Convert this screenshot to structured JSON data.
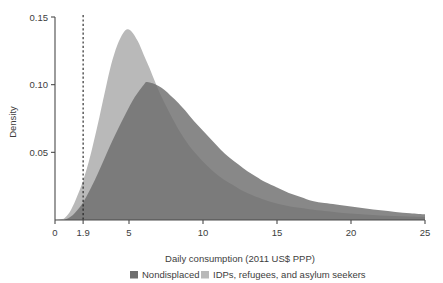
{
  "chart_data": {
    "type": "area",
    "title": "",
    "subtitle": "",
    "xlabel": "Daily consumption (2011 US$ PPP)",
    "ylabel": "Density",
    "xlim": [
      0,
      25
    ],
    "ylim": [
      0,
      0.15
    ],
    "grid": false,
    "legend_position": "bottom",
    "x_ticks": [
      {
        "value": 0,
        "label": "0"
      },
      {
        "value": 1.9,
        "label": "1.9"
      },
      {
        "value": 5,
        "label": "5"
      },
      {
        "value": 10,
        "label": "10"
      },
      {
        "value": 15,
        "label": "15"
      },
      {
        "value": 20,
        "label": "20"
      },
      {
        "value": 25,
        "label": "25"
      }
    ],
    "y_ticks": [
      {
        "value": 0.05,
        "label": "0.05"
      },
      {
        "value": 0.1,
        "label": "0.10"
      },
      {
        "value": 0.15,
        "label": "0.15"
      }
    ],
    "annotations": [
      {
        "name": "poverty-line",
        "type": "vline",
        "x": 1.9,
        "style": "dashed",
        "label": "1.9"
      }
    ],
    "colors": {
      "nondisplaced": "#6e6e6e",
      "displaced": "#b9b9b9",
      "overlap": "#8c8c8c",
      "axis": "#4a4a4a",
      "text": "#3d3d3d",
      "reference_line": "#1f1f1f"
    },
    "series": [
      {
        "name": "Nondisplaced",
        "color": "#6e6e6e",
        "x": [
          0.6,
          1.0,
          1.4,
          1.9,
          2.4,
          3.0,
          3.6,
          4.2,
          4.8,
          5.4,
          6.0,
          6.2,
          6.6,
          7.0,
          7.4,
          7.8,
          8.2,
          8.8,
          9.4,
          10.0,
          10.6,
          11.2,
          11.8,
          12.4,
          13.0,
          13.6,
          14.2,
          15.0,
          15.8,
          16.6,
          17.4,
          18.2,
          19.0,
          20.0,
          21.0,
          22.0,
          23.0,
          24.0,
          25.0
        ],
        "values": [
          0.0,
          0.002,
          0.006,
          0.013,
          0.023,
          0.037,
          0.052,
          0.066,
          0.079,
          0.091,
          0.1,
          0.102,
          0.101,
          0.099,
          0.096,
          0.092,
          0.088,
          0.081,
          0.073,
          0.066,
          0.059,
          0.052,
          0.046,
          0.041,
          0.036,
          0.032,
          0.028,
          0.024,
          0.02,
          0.017,
          0.014,
          0.0125,
          0.0115,
          0.01,
          0.0085,
          0.0072,
          0.006,
          0.005,
          0.0042
        ]
      },
      {
        "name": "IDPs, refugees, and asylum seekers",
        "color": "#b9b9b9",
        "x": [
          0.6,
          1.0,
          1.4,
          1.9,
          2.4,
          3.0,
          3.4,
          3.8,
          4.2,
          4.6,
          4.9,
          5.2,
          5.6,
          6.0,
          6.4,
          6.8,
          7.2,
          7.8,
          8.4,
          9.0,
          9.6,
          10.2,
          10.8,
          11.4,
          12.0,
          12.6,
          13.2,
          14.0,
          14.8,
          15.6,
          16.4,
          17.2,
          18.0,
          19.0,
          20.0,
          21.0,
          22.0,
          23.0,
          24.0,
          25.0
        ],
        "values": [
          0.001,
          0.006,
          0.015,
          0.029,
          0.048,
          0.076,
          0.096,
          0.115,
          0.129,
          0.138,
          0.141,
          0.139,
          0.132,
          0.122,
          0.112,
          0.101,
          0.091,
          0.078,
          0.066,
          0.056,
          0.048,
          0.041,
          0.035,
          0.03,
          0.026,
          0.022,
          0.019,
          0.0155,
          0.0128,
          0.0108,
          0.0092,
          0.008,
          0.007,
          0.0058,
          0.0048,
          0.004,
          0.0034,
          0.0029,
          0.0025,
          0.0022
        ]
      }
    ]
  },
  "legend": {
    "items": [
      {
        "label": "Nondisplaced",
        "color": "#6e6e6e"
      },
      {
        "label": "IDPs, refugees, and asylum seekers",
        "color": "#b9b9b9"
      }
    ]
  }
}
